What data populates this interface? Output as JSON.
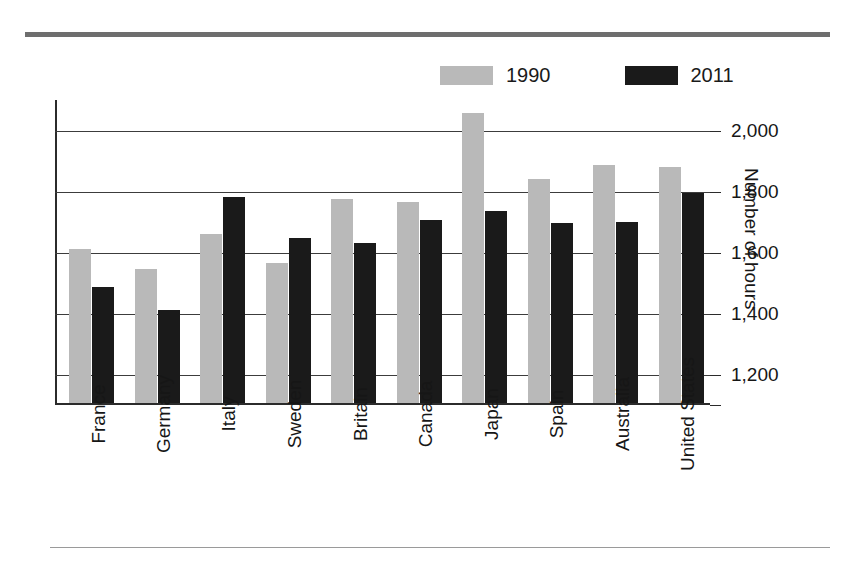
{
  "chart_data": {
    "type": "bar",
    "title": "",
    "xlabel": "",
    "ylabel": "Number of hours",
    "ylim": [
      1100,
      2100
    ],
    "grid": true,
    "legend_position": "top",
    "categories": [
      "France",
      "Germany",
      "Italy",
      "Sweden",
      "Britain",
      "Canada",
      "Japan",
      "Spain",
      "Australia",
      "United States"
    ],
    "yticks": [
      1200,
      1400,
      1600,
      1800,
      2000
    ],
    "ytick_labels": [
      "1,200",
      "1,400",
      "1,600",
      "1,800",
      "2,000"
    ],
    "series": [
      {
        "name": "1990",
        "color": "#b9b9b9",
        "values": [
          1605,
          1540,
          1655,
          1560,
          1770,
          1760,
          2050,
          1835,
          1880,
          1875
        ]
      },
      {
        "name": "2011",
        "color": "#1a1a1a",
        "values": [
          1480,
          1405,
          1775,
          1640,
          1625,
          1700,
          1730,
          1690,
          1695,
          1790
        ]
      }
    ]
  },
  "decor": {
    "top_rule_color": "#6e6e6e",
    "bottom_rule_color": "#9a9a9a"
  }
}
